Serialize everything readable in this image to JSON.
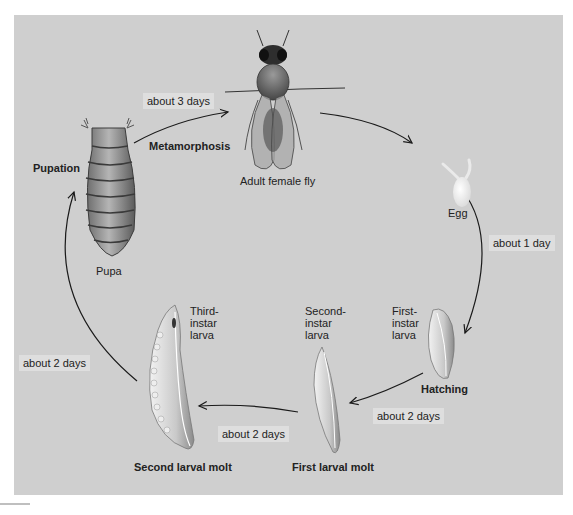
{
  "diagram": {
    "type": "life-cycle",
    "colors": {
      "panel_background": "#cfcfcf",
      "label_box_background": "#dedede",
      "arrow_color": "#1a1a1a",
      "text_color": "#222222"
    },
    "stages": {
      "adult": "Adult female fly",
      "egg": "Egg",
      "first_instar": "First-\ninstar\nlarva",
      "second_instar": "Second-\ninstar\nlarva",
      "third_instar": "Third-\ninstar\nlarva",
      "pupa": "Pupa"
    },
    "events": {
      "metamorphosis": "Metamorphosis",
      "pupation": "Pupation",
      "hatching": "Hatching",
      "first_molt": "First larval molt",
      "second_molt": "Second larval molt"
    },
    "durations": {
      "pupa_to_adult": "about 3 days",
      "egg_to_larva": "about 1 day",
      "first_to_second": "about 2 days",
      "second_to_third": "about 2 days",
      "third_to_pupa": "about 2 days"
    }
  }
}
